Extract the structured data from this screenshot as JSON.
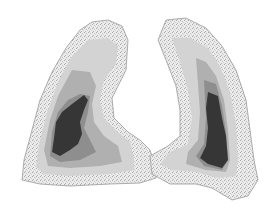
{
  "image": {
    "subject": "lung perfusion contour map",
    "background": "#ffffff",
    "levels": {
      "outer_rim": "#e4e4e4",
      "rim_speckle": "#b8b8b8",
      "level1": "#cfcfcf",
      "level2": "#adadad",
      "level3": "#8a8a8a",
      "level4": "#3a3a3a"
    }
  }
}
